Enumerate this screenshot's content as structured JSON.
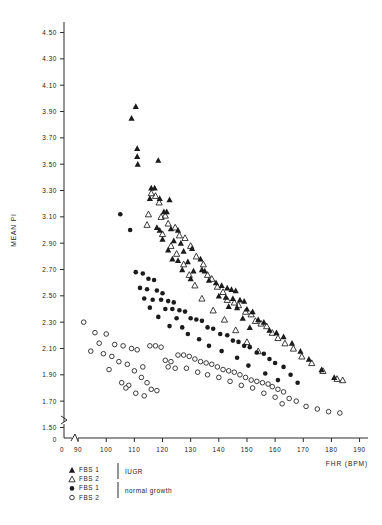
{
  "chart_data": {
    "type": "scatter",
    "title": "",
    "xlabel": "FHR (BPM)",
    "ylabel": "MEAN PI",
    "xlim": [
      85,
      193
    ],
    "ylim": [
      1.42,
      4.58
    ],
    "grid": false,
    "axis_break_x": true,
    "axis_break_y": true,
    "x_origin_label": "0",
    "y_origin_label": "0",
    "xticks": [
      90,
      100,
      110,
      120,
      130,
      140,
      150,
      160,
      170,
      180,
      190
    ],
    "xtick_labels": [
      "90",
      "100",
      "110",
      "120",
      "130",
      "140",
      "150",
      "160",
      "170",
      "180",
      "190"
    ],
    "yticks": [
      1.5,
      1.7,
      1.9,
      2.1,
      2.3,
      2.5,
      2.7,
      2.9,
      3.1,
      3.3,
      3.5,
      3.7,
      3.9,
      4.1,
      4.3,
      4.5
    ],
    "ytick_labels": [
      "1.50",
      "1.70",
      "1.90",
      "2.10",
      "2.30",
      "2.50",
      "2.70",
      "2.90",
      "3.10",
      "3.30",
      "3.50",
      "3.70",
      "3.90",
      "4.10",
      "4.30",
      "4.50"
    ],
    "legend_position": "below-axes",
    "legend": [
      {
        "marker": "filled-triangle",
        "label": "FBS 1",
        "group": "IUGR"
      },
      {
        "marker": "open-triangle",
        "label": "FBS 2",
        "group": "IUGR"
      },
      {
        "marker": "filled-circle",
        "label": "FBS 1",
        "group": "normal growth"
      },
      {
        "marker": "open-circle",
        "label": "FBS 2",
        "group": "normal growth"
      }
    ],
    "group_labels": [
      "IUGR",
      "normal growth"
    ],
    "series": [
      {
        "name": "FBS 1 IUGR",
        "marker": "filled-triangle",
        "points": [
          [
            110.5,
            3.94
          ],
          [
            109.0,
            3.85
          ],
          [
            111.0,
            3.62
          ],
          [
            111.0,
            3.56
          ],
          [
            111.2,
            3.5
          ],
          [
            118.5,
            3.53
          ],
          [
            116.0,
            3.32
          ],
          [
            117.2,
            3.32
          ],
          [
            115.5,
            3.24
          ],
          [
            119.0,
            3.24
          ],
          [
            122.5,
            3.23
          ],
          [
            120.5,
            3.14
          ],
          [
            121.5,
            3.14
          ],
          [
            118.0,
            3.02
          ],
          [
            119.0,
            3.0
          ],
          [
            123.0,
            3.01
          ],
          [
            125.5,
            3.0
          ],
          [
            120.0,
            2.93
          ],
          [
            124.0,
            2.92
          ],
          [
            126.5,
            2.9
          ],
          [
            122.0,
            2.85
          ],
          [
            127.5,
            2.84
          ],
          [
            130.5,
            2.86
          ],
          [
            123.5,
            2.78
          ],
          [
            125.5,
            2.77
          ],
          [
            129.0,
            2.76
          ],
          [
            133.5,
            2.78
          ],
          [
            127.0,
            2.7
          ],
          [
            131.0,
            2.69
          ],
          [
            134.0,
            2.7
          ],
          [
            135.0,
            2.69
          ],
          [
            130.0,
            2.63
          ],
          [
            136.5,
            2.62
          ],
          [
            139.0,
            2.6
          ],
          [
            141.0,
            2.58
          ],
          [
            143.0,
            2.56
          ],
          [
            144.5,
            2.55
          ],
          [
            146.0,
            2.54
          ],
          [
            140.0,
            2.5
          ],
          [
            142.5,
            2.49
          ],
          [
            145.0,
            2.48
          ],
          [
            147.5,
            2.47
          ],
          [
            149.0,
            2.46
          ],
          [
            143.5,
            2.42
          ],
          [
            146.5,
            2.41
          ],
          [
            150.0,
            2.4
          ],
          [
            152.0,
            2.38
          ],
          [
            148.5,
            2.33
          ],
          [
            154.0,
            2.32
          ],
          [
            156.0,
            2.3
          ],
          [
            151.0,
            2.26
          ],
          [
            158.0,
            2.24
          ],
          [
            160.5,
            2.22
          ],
          [
            163.0,
            2.19
          ],
          [
            166.0,
            2.14
          ],
          [
            169.0,
            2.08
          ],
          [
            172.0,
            2.02
          ],
          [
            176.5,
            1.94
          ],
          [
            181.0,
            1.88
          ]
        ]
      },
      {
        "name": "FBS 2 IUGR",
        "marker": "open-triangle",
        "points": [
          [
            116.0,
            3.28
          ],
          [
            117.5,
            3.26
          ],
          [
            118.8,
            3.21
          ],
          [
            115.0,
            3.12
          ],
          [
            119.5,
            3.1
          ],
          [
            121.0,
            3.11
          ],
          [
            114.5,
            3.04
          ],
          [
            122.0,
            3.05
          ],
          [
            124.5,
            3.02
          ],
          [
            120.0,
            2.97
          ],
          [
            126.0,
            2.96
          ],
          [
            128.0,
            2.94
          ],
          [
            123.0,
            2.88
          ],
          [
            130.0,
            2.88
          ],
          [
            125.0,
            2.82
          ],
          [
            132.0,
            2.8
          ],
          [
            127.5,
            2.74
          ],
          [
            134.5,
            2.74
          ],
          [
            129.5,
            2.66
          ],
          [
            136.0,
            2.66
          ],
          [
            137.5,
            2.63
          ],
          [
            131.5,
            2.58
          ],
          [
            139.5,
            2.57
          ],
          [
            141.5,
            2.53
          ],
          [
            134.0,
            2.48
          ],
          [
            143.0,
            2.47
          ],
          [
            145.5,
            2.45
          ],
          [
            147.0,
            2.43
          ],
          [
            138.0,
            2.39
          ],
          [
            149.5,
            2.38
          ],
          [
            151.5,
            2.36
          ],
          [
            142.0,
            2.32
          ],
          [
            153.0,
            2.31
          ],
          [
            155.0,
            2.29
          ],
          [
            157.0,
            2.27
          ],
          [
            146.0,
            2.24
          ],
          [
            159.0,
            2.22
          ],
          [
            161.0,
            2.18
          ],
          [
            150.0,
            2.15
          ],
          [
            163.5,
            2.14
          ],
          [
            166.5,
            2.1
          ],
          [
            154.0,
            2.08
          ],
          [
            169.5,
            2.04
          ],
          [
            173.0,
            1.99
          ],
          [
            177.0,
            1.93
          ],
          [
            182.0,
            1.87
          ],
          [
            184.0,
            1.86
          ]
        ]
      },
      {
        "name": "FBS 1 normal growth",
        "marker": "filled-circle",
        "points": [
          [
            105.0,
            3.12
          ],
          [
            108.5,
            3.0
          ],
          [
            110.5,
            2.68
          ],
          [
            113.0,
            2.67
          ],
          [
            115.0,
            2.63
          ],
          [
            117.0,
            2.62
          ],
          [
            112.0,
            2.56
          ],
          [
            114.5,
            2.55
          ],
          [
            118.0,
            2.54
          ],
          [
            120.0,
            2.52
          ],
          [
            113.5,
            2.48
          ],
          [
            116.5,
            2.47
          ],
          [
            119.5,
            2.47
          ],
          [
            122.0,
            2.46
          ],
          [
            124.0,
            2.45
          ],
          [
            115.5,
            2.41
          ],
          [
            121.0,
            2.4
          ],
          [
            123.5,
            2.4
          ],
          [
            126.0,
            2.39
          ],
          [
            128.0,
            2.38
          ],
          [
            118.5,
            2.34
          ],
          [
            125.0,
            2.33
          ],
          [
            130.0,
            2.33
          ],
          [
            132.0,
            2.32
          ],
          [
            134.0,
            2.31
          ],
          [
            122.5,
            2.27
          ],
          [
            127.0,
            2.26
          ],
          [
            136.0,
            2.26
          ],
          [
            138.0,
            2.25
          ],
          [
            129.0,
            2.21
          ],
          [
            140.5,
            2.21
          ],
          [
            143.0,
            2.2
          ],
          [
            133.0,
            2.17
          ],
          [
            145.0,
            2.16
          ],
          [
            147.0,
            2.15
          ],
          [
            136.5,
            2.12
          ],
          [
            149.0,
            2.12
          ],
          [
            151.0,
            2.11
          ],
          [
            141.0,
            2.08
          ],
          [
            153.5,
            2.07
          ],
          [
            156.0,
            2.06
          ],
          [
            146.5,
            2.03
          ],
          [
            158.0,
            2.02
          ],
          [
            160.0,
            1.99
          ],
          [
            150.5,
            1.97
          ],
          [
            163.0,
            1.96
          ],
          [
            156.5,
            1.91
          ],
          [
            165.5,
            1.9
          ],
          [
            161.0,
            1.86
          ],
          [
            168.0,
            1.84
          ]
        ]
      },
      {
        "name": "FBS 2 normal growth",
        "marker": "open-circle",
        "points": [
          [
            92.0,
            2.3
          ],
          [
            96.0,
            2.22
          ],
          [
            100.0,
            2.21
          ],
          [
            97.5,
            2.14
          ],
          [
            103.0,
            2.13
          ],
          [
            94.5,
            2.08
          ],
          [
            99.0,
            2.06
          ],
          [
            102.0,
            2.04
          ],
          [
            106.0,
            2.12
          ],
          [
            109.0,
            2.1
          ],
          [
            111.0,
            2.09
          ],
          [
            104.5,
            2.0
          ],
          [
            107.5,
            1.98
          ],
          [
            101.0,
            1.94
          ],
          [
            110.0,
            1.93
          ],
          [
            113.0,
            1.96
          ],
          [
            115.5,
            2.12
          ],
          [
            117.5,
            2.12
          ],
          [
            119.5,
            2.11
          ],
          [
            112.5,
            1.88
          ],
          [
            105.5,
            1.84
          ],
          [
            108.0,
            1.82
          ],
          [
            114.5,
            1.84
          ],
          [
            116.0,
            1.79
          ],
          [
            110.5,
            1.76
          ],
          [
            113.5,
            1.74
          ],
          [
            107.0,
            1.8
          ],
          [
            118.0,
            1.78
          ],
          [
            121.0,
            2.01
          ],
          [
            123.0,
            2.0
          ],
          [
            125.5,
            2.05
          ],
          [
            127.5,
            2.05
          ],
          [
            129.5,
            2.04
          ],
          [
            122.0,
            1.96
          ],
          [
            124.5,
            1.95
          ],
          [
            131.5,
            2.02
          ],
          [
            133.5,
            2.0
          ],
          [
            128.5,
            1.95
          ],
          [
            135.5,
            1.99
          ],
          [
            137.5,
            1.98
          ],
          [
            132.5,
            1.92
          ],
          [
            139.5,
            1.96
          ],
          [
            141.5,
            1.94
          ],
          [
            136.0,
            1.9
          ],
          [
            143.5,
            1.93
          ],
          [
            145.5,
            1.92
          ],
          [
            140.0,
            1.88
          ],
          [
            147.5,
            1.9
          ],
          [
            149.5,
            1.88
          ],
          [
            144.0,
            1.85
          ],
          [
            151.5,
            1.86
          ],
          [
            153.5,
            1.85
          ],
          [
            148.0,
            1.82
          ],
          [
            155.5,
            1.84
          ],
          [
            157.5,
            1.83
          ],
          [
            152.0,
            1.8
          ],
          [
            159.0,
            1.81
          ],
          [
            161.0,
            1.79
          ],
          [
            156.0,
            1.76
          ],
          [
            163.0,
            1.77
          ],
          [
            160.0,
            1.73
          ],
          [
            165.0,
            1.72
          ],
          [
            162.5,
            1.68
          ],
          [
            167.5,
            1.7
          ],
          [
            171.0,
            1.66
          ],
          [
            175.0,
            1.64
          ],
          [
            179.0,
            1.62
          ],
          [
            183.0,
            1.61
          ]
        ]
      }
    ]
  }
}
